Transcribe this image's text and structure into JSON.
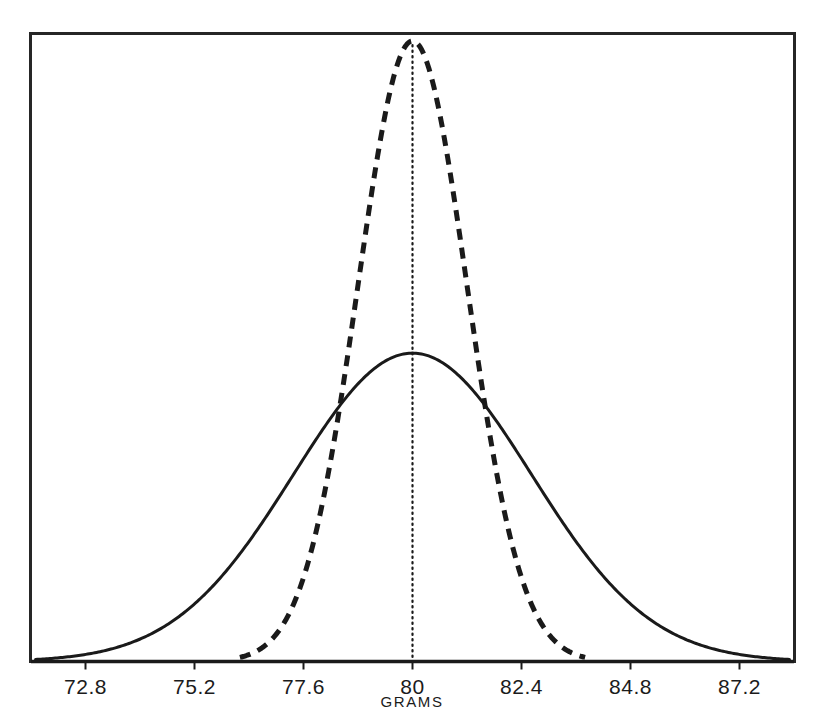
{
  "figure": {
    "background_color": "#ffffff",
    "frame_color": "#262626",
    "ink_color": "#1a1a1a"
  },
  "chart_data": {
    "type": "line",
    "title": "",
    "subtitle": "",
    "xlabel": "GRAMS",
    "ylabel": "",
    "grid": false,
    "legend_position": "none",
    "xlim": [
      71.6,
      88.4
    ],
    "ylim": [
      0,
      1.0
    ],
    "xticks": [
      72.8,
      75.2,
      77.6,
      80,
      82.4,
      84.8,
      87.2
    ],
    "xtick_labels": [
      "72.8",
      "75.2",
      "77.6",
      "80",
      "82.4",
      "84.8",
      "87.2"
    ],
    "xtick_step": 2.4,
    "yticks": [],
    "ytick_labels": [],
    "annotations": [
      {
        "name": "mean-center-line",
        "style": "dotted-vertical",
        "x": 80,
        "label": ""
      }
    ],
    "series": [
      {
        "name": "narrow-distribution",
        "style": "dashed",
        "distribution": "normal",
        "mean": 80,
        "std_dev": 1.2,
        "peak_height": 1.0,
        "x_start": 76.2,
        "x_end": 83.8,
        "color": "#1a1a1a",
        "line_width": 5,
        "dash_pattern": "11 8"
      },
      {
        "name": "wide-distribution",
        "style": "solid",
        "distribution": "normal",
        "mean": 80,
        "std_dev": 2.62,
        "peak_height": 0.497,
        "x_start": 71.7,
        "x_end": 88.3,
        "color": "#1a1a1a",
        "line_width": 3,
        "dash_pattern": "none"
      }
    ]
  }
}
